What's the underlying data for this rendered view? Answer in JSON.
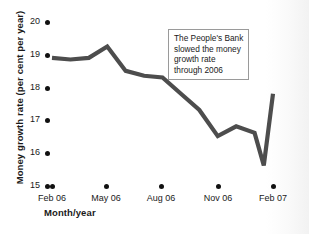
{
  "chart_data": {
    "type": "line",
    "title": "",
    "subtitle": "",
    "xlabel": "Month/year",
    "ylabel": "Money growth rate (per cent per year)",
    "xlim": [
      0,
      12
    ],
    "ylim": [
      15,
      20
    ],
    "grid": false,
    "legend": null,
    "legend_position": "none",
    "line_color": "#4d4d4d",
    "annotation_text": "The People's Bank slowed the money growth rate through 2006",
    "annotations": [
      {
        "text": "The People's Bank slowed the money growth rate through 2006",
        "lines": [
          "The People's Bank",
          "slowed the money",
          "growth rate",
          "through 2006"
        ]
      }
    ],
    "x_tick_labels": [
      "Feb 06",
      "May 06",
      "Aug 06",
      "Nov 06",
      "Feb 07"
    ],
    "x_tick_months": [
      0,
      3,
      6,
      9,
      12
    ],
    "y_tick_labels": [
      "20",
      "19",
      "18",
      "17",
      "16",
      "15"
    ],
    "y_tick_values": [
      20,
      19,
      18,
      17,
      16,
      15
    ],
    "x": [
      0,
      1,
      2,
      3,
      4,
      5,
      6,
      7,
      8,
      9,
      10,
      11,
      11.5,
      12
    ],
    "values": [
      18.9,
      18.85,
      18.9,
      19.25,
      18.5,
      18.35,
      18.3,
      17.8,
      17.3,
      16.5,
      16.8,
      16.6,
      15.6,
      17.8
    ],
    "points": [
      {
        "label": "Feb 06",
        "x": 0,
        "y": 18.9
      },
      {
        "label": "Mar 06",
        "x": 1,
        "y": 18.85
      },
      {
        "label": "Apr 06",
        "x": 2,
        "y": 18.9
      },
      {
        "label": "May 06",
        "x": 3,
        "y": 19.25
      },
      {
        "label": "Jun 06",
        "x": 4,
        "y": 18.5
      },
      {
        "label": "Jul 06",
        "x": 5,
        "y": 18.35
      },
      {
        "label": "Aug 06",
        "x": 6,
        "y": 18.3
      },
      {
        "label": "Sep 06",
        "x": 7,
        "y": 17.8
      },
      {
        "label": "Oct 06",
        "x": 8,
        "y": 17.3
      },
      {
        "label": "Nov 06",
        "x": 9,
        "y": 16.5
      },
      {
        "label": "Dec 06",
        "x": 10,
        "y": 16.8
      },
      {
        "label": "Jan 07",
        "x": 11,
        "y": 16.6
      },
      {
        "label": "Jan 07b",
        "x": 11.5,
        "y": 15.6
      },
      {
        "label": "Feb 07",
        "x": 12,
        "y": 17.8
      }
    ]
  },
  "axes": {
    "ylabel": "Money growth rate (per cent per year)",
    "xlabel": "Month/year"
  },
  "yticks": [
    {
      "label": "20"
    },
    {
      "label": "19"
    },
    {
      "label": "18"
    },
    {
      "label": "17"
    },
    {
      "label": "16"
    },
    {
      "label": "15"
    }
  ],
  "xticks": [
    {
      "label": "Feb 06"
    },
    {
      "label": "May 06"
    },
    {
      "label": "Aug 06"
    },
    {
      "label": "Nov 06"
    },
    {
      "label": "Feb 07"
    }
  ],
  "annotation": {
    "line1": "The People's Bank",
    "line2": "slowed the money",
    "line3": "growth rate",
    "line4": "through 2006"
  }
}
